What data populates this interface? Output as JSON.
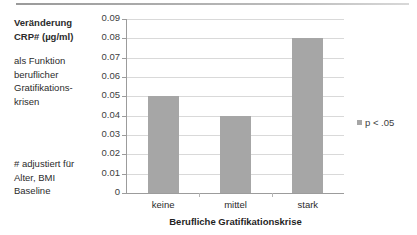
{
  "annotation": {
    "title_line1": "Veränderung",
    "title_line2": "CRP# (µg/ml)",
    "subtitle_line1": "als Funktion",
    "subtitle_line2": "beruflicher",
    "subtitle_line3": "Gratifikations-",
    "subtitle_line4": "krisen",
    "footnote_line1": "# adjustiert für",
    "footnote_line2": "Alter, BMI",
    "footnote_line3": "Baseline"
  },
  "legend": {
    "entries": [
      {
        "label": "p < .05",
        "color": "#a6a6a6",
        "marker": "square-swatch"
      }
    ],
    "position": "right-middle"
  },
  "colors": {
    "bar_fill": "#a6a6a6",
    "gridline": "#d9d9d9",
    "axis": "#9c9c9c",
    "text": "#2b2b2b"
  },
  "chart_data": {
    "type": "bar",
    "categories": [
      "keine",
      "mittel",
      "stark"
    ],
    "values": [
      0.05,
      0.04,
      0.08
    ],
    "series": [
      {
        "name": "p < .05",
        "values": [
          0.05,
          0.04,
          0.08
        ]
      }
    ],
    "xlabel": "Berufliche Gratifikationskrise",
    "ylabel": "Veränderung CRP# (µg/ml)",
    "ylim": [
      0,
      0.09
    ],
    "ytick_step": 0.01,
    "yticks": [
      "0.09",
      "0.08",
      "0.07",
      "0.06",
      "0.05",
      "0.04",
      "0.03",
      "0.02",
      "0.01",
      "0"
    ],
    "ytick_values": [
      0.09,
      0.08,
      0.07,
      0.06,
      0.05,
      0.04,
      0.03,
      0.02,
      0.01,
      0
    ],
    "grid": true,
    "legend_position": "right",
    "annotations": [
      "# adjustiert für Alter, BMI Baseline",
      "p < .05"
    ]
  }
}
